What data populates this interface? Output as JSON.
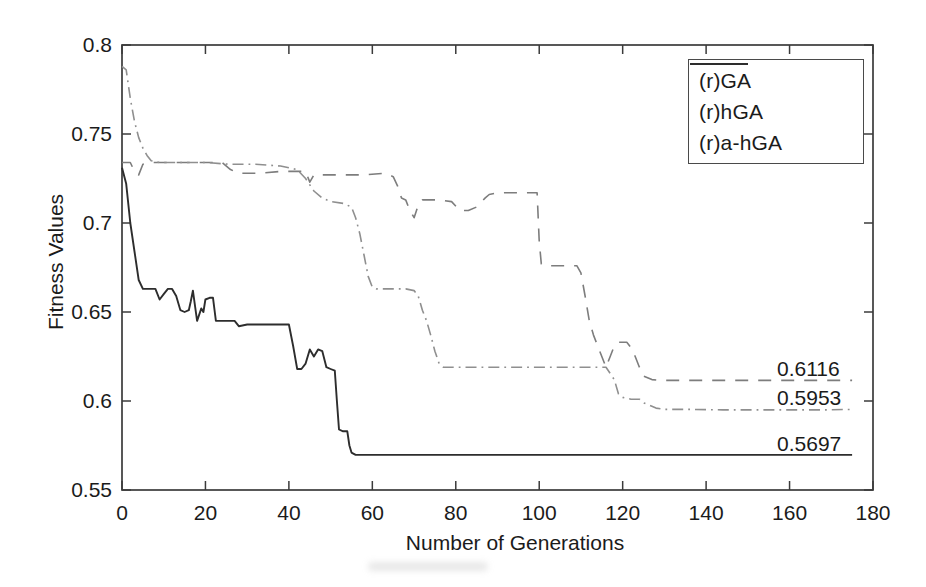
{
  "palette": {
    "axis": "#3b3b3b",
    "text": "#1b1b1b",
    "ga": "#7d7d7d",
    "hga": "#8f8f8f",
    "ahga": "#2d2d2d",
    "background": "#ffffff"
  },
  "chart_data": {
    "type": "line",
    "title": "",
    "xlabel": "Number of Generations",
    "ylabel": "Fitness Values",
    "xlim": [
      0,
      180
    ],
    "ylim": [
      0.55,
      0.8
    ],
    "xticks": [
      0,
      20,
      40,
      60,
      80,
      100,
      120,
      140,
      160,
      180
    ],
    "xtick_labels": [
      "0",
      "20",
      "40",
      "60",
      "80",
      "100",
      "120",
      "140",
      "160",
      "180"
    ],
    "yticks": [
      0.55,
      0.6,
      0.65,
      0.7,
      0.75,
      0.8
    ],
    "ytick_labels": [
      "0.55",
      "0.6",
      "0.65",
      "0.7",
      "0.75",
      "0.8"
    ],
    "grid": false,
    "legend_position": "top-right",
    "series": [
      {
        "name": "(r)GA",
        "slug": "rga",
        "style": "dashed",
        "color_key": "ga",
        "final_value": 0.6116,
        "points": [
          [
            0,
            0.734
          ],
          [
            2,
            0.734
          ],
          [
            3,
            0.729
          ],
          [
            4,
            0.727
          ],
          [
            5,
            0.733
          ],
          [
            7,
            0.734
          ],
          [
            12,
            0.734
          ],
          [
            18,
            0.734
          ],
          [
            24,
            0.734
          ],
          [
            26,
            0.73
          ],
          [
            28,
            0.728
          ],
          [
            33,
            0.728
          ],
          [
            38,
            0.729
          ],
          [
            44,
            0.729
          ],
          [
            45,
            0.723
          ],
          [
            46,
            0.727
          ],
          [
            52,
            0.727
          ],
          [
            58,
            0.727
          ],
          [
            63,
            0.728
          ],
          [
            65,
            0.726
          ],
          [
            66,
            0.721
          ],
          [
            67,
            0.714
          ],
          [
            68,
            0.713
          ],
          [
            69,
            0.707
          ],
          [
            70,
            0.703
          ],
          [
            71,
            0.71
          ],
          [
            72,
            0.713
          ],
          [
            76,
            0.713
          ],
          [
            79,
            0.712
          ],
          [
            81,
            0.707
          ],
          [
            83,
            0.707
          ],
          [
            85,
            0.709
          ],
          [
            87,
            0.714
          ],
          [
            88,
            0.716
          ],
          [
            90,
            0.717
          ],
          [
            94,
            0.717
          ],
          [
            99.5,
            0.717
          ],
          [
            100,
            0.69
          ],
          [
            100.5,
            0.677
          ],
          [
            101,
            0.676
          ],
          [
            105,
            0.676
          ],
          [
            109,
            0.676
          ],
          [
            110,
            0.672
          ],
          [
            111,
            0.659
          ],
          [
            112,
            0.645
          ],
          [
            113,
            0.637
          ],
          [
            115,
            0.625
          ],
          [
            116,
            0.619
          ],
          [
            117,
            0.625
          ],
          [
            118,
            0.631
          ],
          [
            119,
            0.633
          ],
          [
            121,
            0.633
          ],
          [
            122,
            0.63
          ],
          [
            123,
            0.625
          ],
          [
            124,
            0.619
          ],
          [
            125,
            0.614
          ],
          [
            127,
            0.612
          ],
          [
            129,
            0.6116
          ],
          [
            135,
            0.6116
          ],
          [
            145,
            0.6116
          ],
          [
            155,
            0.6116
          ],
          [
            165,
            0.6116
          ],
          [
            175,
            0.6116
          ]
        ]
      },
      {
        "name": "(r)hGA",
        "slug": "rhga",
        "style": "dashdot",
        "color_key": "hga",
        "final_value": 0.5953,
        "points": [
          [
            0,
            0.788
          ],
          [
            1,
            0.786
          ],
          [
            2,
            0.77
          ],
          [
            3,
            0.757
          ],
          [
            4,
            0.748
          ],
          [
            5,
            0.742
          ],
          [
            6,
            0.738
          ],
          [
            7,
            0.735
          ],
          [
            9,
            0.734
          ],
          [
            14,
            0.734
          ],
          [
            20,
            0.734
          ],
          [
            26,
            0.733
          ],
          [
            32,
            0.733
          ],
          [
            38,
            0.732
          ],
          [
            42,
            0.73
          ],
          [
            44,
            0.725
          ],
          [
            46,
            0.718
          ],
          [
            48,
            0.714
          ],
          [
            50,
            0.712
          ],
          [
            53,
            0.711
          ],
          [
            55,
            0.709
          ],
          [
            56,
            0.703
          ],
          [
            57,
            0.694
          ],
          [
            58,
            0.682
          ],
          [
            59,
            0.67
          ],
          [
            60,
            0.664
          ],
          [
            61,
            0.663
          ],
          [
            64,
            0.663
          ],
          [
            68,
            0.663
          ],
          [
            70,
            0.662
          ],
          [
            71,
            0.659
          ],
          [
            72,
            0.651
          ],
          [
            73,
            0.645
          ],
          [
            74,
            0.637
          ],
          [
            75,
            0.628
          ],
          [
            76,
            0.621
          ],
          [
            77,
            0.619
          ],
          [
            82,
            0.619
          ],
          [
            88,
            0.619
          ],
          [
            94,
            0.619
          ],
          [
            100,
            0.619
          ],
          [
            106,
            0.619
          ],
          [
            112,
            0.619
          ],
          [
            116,
            0.619
          ],
          [
            118,
            0.612
          ],
          [
            119,
            0.604
          ],
          [
            120,
            0.602
          ],
          [
            122,
            0.601
          ],
          [
            124,
            0.601
          ],
          [
            125,
            0.599
          ],
          [
            127,
            0.597
          ],
          [
            128,
            0.596
          ],
          [
            130,
            0.5953
          ],
          [
            136,
            0.5953
          ],
          [
            144,
            0.595
          ],
          [
            152,
            0.595
          ],
          [
            160,
            0.595
          ],
          [
            168,
            0.595
          ],
          [
            175,
            0.5953
          ]
        ]
      },
      {
        "name": "(r)a-hGA",
        "slug": "rahga",
        "style": "solid",
        "color_key": "ahga",
        "final_value": 0.5697,
        "points": [
          [
            0,
            0.731
          ],
          [
            1,
            0.722
          ],
          [
            2,
            0.7
          ],
          [
            3,
            0.684
          ],
          [
            4,
            0.668
          ],
          [
            5,
            0.663
          ],
          [
            8,
            0.663
          ],
          [
            9,
            0.657
          ],
          [
            10,
            0.66
          ],
          [
            11,
            0.663
          ],
          [
            12,
            0.663
          ],
          [
            13,
            0.659
          ],
          [
            14,
            0.651
          ],
          [
            15,
            0.65
          ],
          [
            16,
            0.651
          ],
          [
            16.5,
            0.656
          ],
          [
            17,
            0.662
          ],
          [
            18,
            0.645
          ],
          [
            19,
            0.652
          ],
          [
            19.5,
            0.65
          ],
          [
            20,
            0.657
          ],
          [
            21,
            0.658
          ],
          [
            21.8,
            0.658
          ],
          [
            22.5,
            0.645
          ],
          [
            24,
            0.645
          ],
          [
            27,
            0.645
          ],
          [
            28,
            0.642
          ],
          [
            30,
            0.643
          ],
          [
            34,
            0.643
          ],
          [
            38,
            0.643
          ],
          [
            40,
            0.643
          ],
          [
            41,
            0.631
          ],
          [
            42,
            0.618
          ],
          [
            43,
            0.618
          ],
          [
            44,
            0.621
          ],
          [
            45,
            0.629
          ],
          [
            46,
            0.625
          ],
          [
            47,
            0.629
          ],
          [
            48,
            0.628
          ],
          [
            49,
            0.619
          ],
          [
            50,
            0.618
          ],
          [
            51,
            0.617
          ],
          [
            51.5,
            0.6
          ],
          [
            52,
            0.584
          ],
          [
            53,
            0.583
          ],
          [
            54,
            0.583
          ],
          [
            54.5,
            0.575
          ],
          [
            55,
            0.571
          ],
          [
            56,
            0.5697
          ],
          [
            62,
            0.5697
          ],
          [
            75,
            0.5697
          ],
          [
            90,
            0.5697
          ],
          [
            110,
            0.5697
          ],
          [
            130,
            0.5697
          ],
          [
            150,
            0.5697
          ],
          [
            165,
            0.5697
          ],
          [
            175,
            0.5697
          ]
        ]
      }
    ],
    "annotations": [
      {
        "text": "0.6116",
        "x": 157,
        "y": 0.6116,
        "slug": "rga"
      },
      {
        "text": "0.5953",
        "x": 157,
        "y": 0.5953,
        "slug": "rhga"
      },
      {
        "text": "0.5697",
        "x": 157,
        "y": 0.5697,
        "slug": "rahga"
      }
    ]
  }
}
